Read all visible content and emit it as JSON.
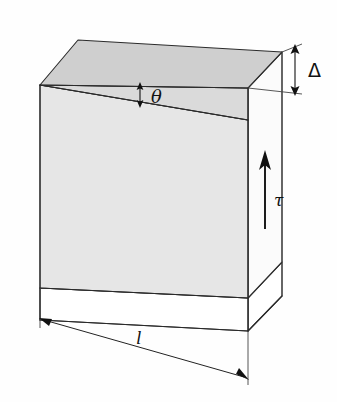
{
  "figure": {
    "type": "technical-line-diagram",
    "background_color": "#fefefe",
    "stroke_color": "#2b2b2b",
    "colors": {
      "top_face": "#cfcfcf",
      "front_face": "#e6e6e6",
      "wedge_face": "#dadada",
      "side_face": "#fbfbfb",
      "base_face": "#ffffff",
      "hidden_edge": "#b9b9b9"
    }
  },
  "labels": {
    "delta": {
      "text": "Δ",
      "meaning": "shear-displacement",
      "x": 306,
      "y": 76
    },
    "theta": {
      "text": "θ",
      "meaning": "shear-angle",
      "x": 153,
      "y": 102
    },
    "tau": {
      "text": "τ",
      "meaning": "shear-stress",
      "x": 276,
      "y": 204
    },
    "length": {
      "text": "l",
      "meaning": "block-length",
      "x": 140,
      "y": 341
    }
  },
  "annotations": {
    "delta_arrow": {
      "name": "delta-dimension-arrow",
      "style": "double-headed-vertical",
      "x": 299,
      "y_top": 46,
      "y_bottom": 92
    },
    "theta_arrow": {
      "name": "theta-angle-arrow",
      "style": "double-headed-vertical-small",
      "x": 140,
      "y_top": 84,
      "y_bottom": 104
    },
    "tau_arrow": {
      "name": "tau-stress-arrow",
      "style": "single-headed-up",
      "x": 265,
      "y_tail": 228,
      "y_head": 152
    },
    "length_dimension": {
      "name": "length-dimension-line",
      "style": "double-headed-diagonal",
      "x1": 46,
      "y1": 321,
      "x2": 246,
      "y2": 378
    }
  },
  "geometry": {
    "top_face": "78,40 282,52 248,88 40,85",
    "wedge_face": "40,85 248,88 248,120 ",
    "front_face": "40,85 248,120 248,298 40,288",
    "side_face": "248,88 282,52 282,262 248,298",
    "base_front": "40,288 248,298 248,330 40,318",
    "base_side": "248,298 282,262 282,296 248,330",
    "hidden_edges": [
      "40,275 248,268",
      "248,268 282,232"
    ]
  }
}
